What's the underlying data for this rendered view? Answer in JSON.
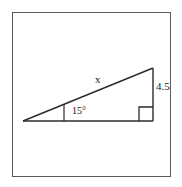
{
  "figure": {
    "type": "right-triangle-diagram",
    "frame": {
      "border_color": "#5a5a5a",
      "background_color": "#ffffff"
    },
    "stroke_color": "#2b2b2b",
    "labels": {
      "hypotenuse": "x",
      "vertical_leg": "4.5",
      "angle": "15°"
    },
    "markers": {
      "right_angle": "right-angle-square",
      "angle_tick": "angle-tick-mark"
    },
    "vertices": {
      "left": [
        23,
        121
      ],
      "bottom_right": [
        153,
        121
      ],
      "top_right": [
        153,
        68
      ]
    }
  }
}
